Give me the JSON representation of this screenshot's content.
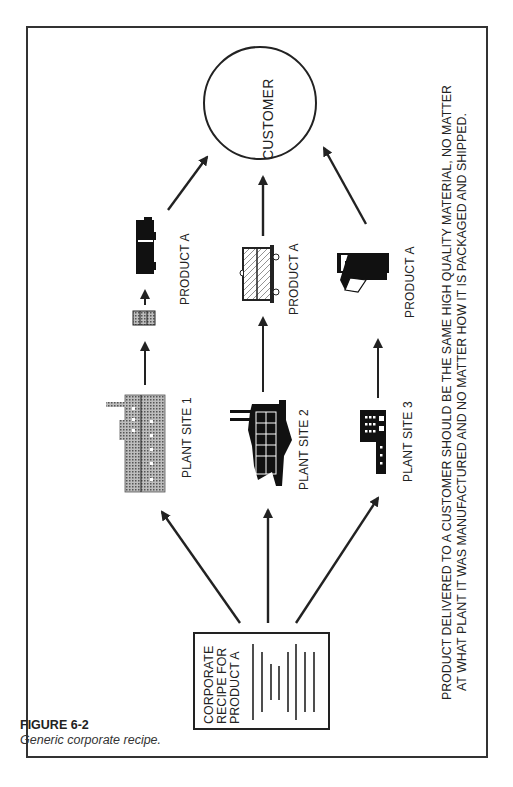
{
  "figure": {
    "number": "FIGURE 6-2",
    "caption": "Generic corporate recipe."
  },
  "nodes": {
    "customer": "CUSTOMER",
    "recipe": [
      "CORPORATE",
      "RECIPE FOR",
      "PRODUCT A"
    ],
    "plants": [
      {
        "label": "PLANT SITE 1",
        "icon": "factory-icon"
      },
      {
        "label": "PLANT SITE 2",
        "icon": "refinery-icon"
      },
      {
        "label": "PLANT SITE 3",
        "icon": "office-building-icon"
      }
    ],
    "products": [
      {
        "label": "PRODUCT A",
        "icon": "truck-icon"
      },
      {
        "label": "PRODUCT A",
        "icon": "railcar-icon"
      },
      {
        "label": "PRODUCT A",
        "icon": "bag-package-icon"
      }
    ]
  },
  "statement": {
    "line1": "PRODUCT DELIVERED TO A CUSTOMER SHOULD BE THE SAME HIGH QUALITY MATERIAL, NO MATTER",
    "line2": "AT WHAT PLANT IT WAS MANUFACTURED AND NO MATTER HOW IT IS PACKAGED AND SHIPPED."
  },
  "colors": {
    "line": "#222222",
    "frame": "#333333",
    "stipple": "#8a8a8a"
  }
}
